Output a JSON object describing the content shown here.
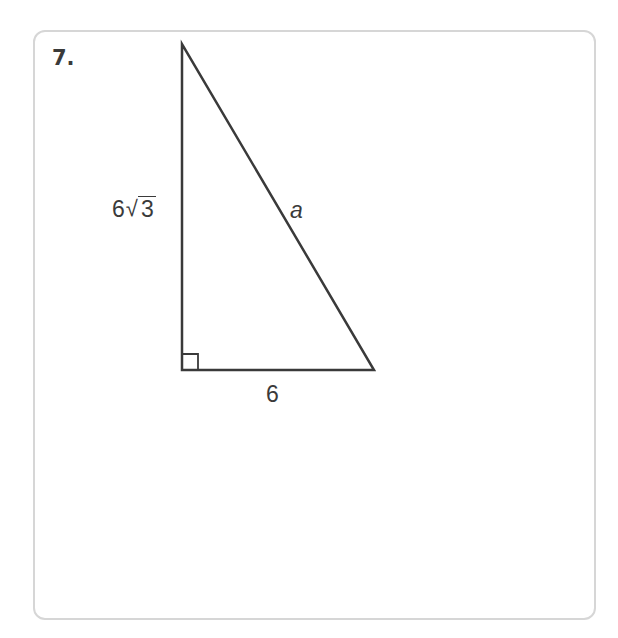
{
  "problem": {
    "number": "7.",
    "figure": {
      "type": "right-triangle",
      "right_angle_at": "bottom-left",
      "vertical_leg": {
        "coefficient": "6",
        "radical_symbol": "√",
        "radicand": "3"
      },
      "horizontal_leg": "6",
      "hypotenuse": "a",
      "colors": {
        "stroke": "#3a3a3a",
        "border": "#d6d6d6"
      }
    }
  }
}
